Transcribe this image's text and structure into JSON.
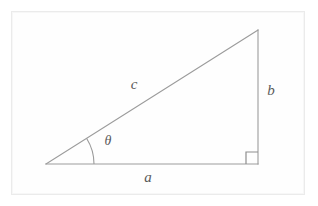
{
  "figure": {
    "name": "right-triangle-trigonometry-diagram",
    "background_color": "#ffffff",
    "frame_color": "#ebebeb",
    "line_color": "#9b9b9b",
    "label_color": "#5a5a5a",
    "width": 318,
    "height": 206
  },
  "labels": {
    "hypotenuse": "c",
    "opposite": "b",
    "adjacent": "a",
    "angle": "θ"
  },
  "geometry": {
    "vertex_left": {
      "x": 46,
      "y": 164
    },
    "vertex_right": {
      "x": 258,
      "y": 164
    },
    "vertex_top": {
      "x": 258,
      "y": 30
    },
    "angle_arc_radius": 48,
    "right_angle_size": 12
  },
  "label_positions": {
    "hypotenuse": {
      "x": 134,
      "y": 86
    },
    "opposite": {
      "x": 271,
      "y": 92
    },
    "adjacent": {
      "x": 148,
      "y": 179
    },
    "angle": {
      "x": 108,
      "y": 142
    }
  }
}
